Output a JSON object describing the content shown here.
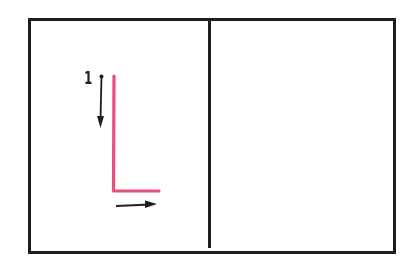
{
  "diagram": {
    "type": "letter-stroke-order",
    "letter": "L",
    "panels": [
      {
        "id": "left",
        "content": "stroke guide for letter L"
      },
      {
        "id": "right",
        "content": "empty practice area"
      }
    ],
    "step_number": "1",
    "colors": {
      "frame": "#1e1e1e",
      "letter_stroke": "#e8507a",
      "arrow": "#1e1e1e",
      "background": "#ffffff"
    },
    "arrows": [
      {
        "direction": "down",
        "description": "first stroke: top to bottom"
      },
      {
        "direction": "right",
        "description": "second stroke: left to right"
      }
    ]
  }
}
